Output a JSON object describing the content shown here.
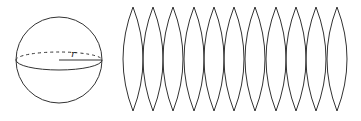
{
  "diagram": {
    "sphere": {
      "cx": 59,
      "cy": 60,
      "r": 43,
      "equator_ry": 8,
      "radius_label": "r",
      "stroke": "#333333"
    },
    "lenses": {
      "count": 11,
      "tips_x": [
        133,
        153,
        173,
        194,
        214,
        234,
        255,
        276,
        296,
        316,
        337
      ],
      "top_y": 7,
      "bottom_y": 111,
      "half_width": 10,
      "stroke": "#333333"
    }
  }
}
